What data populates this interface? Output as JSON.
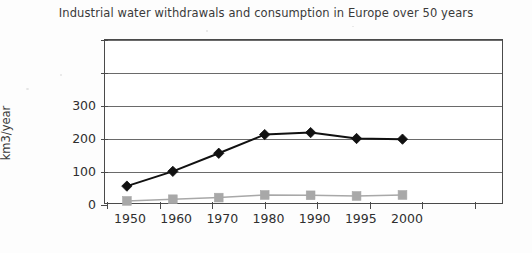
{
  "chart_data": {
    "type": "line",
    "title": "Industrial water withdrawals and consumption in Europe over 50 years",
    "xlabel": "",
    "ylabel": "Industrial water use km3/year",
    "ylabel_line1": "Industrial water use",
    "ylabel_line2": "km3/year",
    "categories": [
      "1950",
      "1960",
      "1970",
      "1980",
      "1990",
      "1995",
      "2000"
    ],
    "ylim": [
      0,
      500
    ],
    "ytick_values": [
      0,
      100,
      200,
      300,
      400,
      500
    ],
    "ytick_labels": [
      "0",
      "100",
      "200",
      "300",
      "",
      ""
    ],
    "grid": true,
    "grid_axis": "y",
    "legend": "none",
    "series": [
      {
        "name": "Industrial water withdrawals",
        "marker": "diamond",
        "color": "#111111",
        "values": [
          55,
          100,
          155,
          212,
          218,
          200,
          198
        ]
      },
      {
        "name": "Industrial water consumption",
        "marker": "square",
        "color": "#a8a8a8",
        "values": [
          10,
          15,
          20,
          28,
          27,
          25,
          28
        ]
      }
    ]
  },
  "colors": {
    "withdrawals": "#111111",
    "consumption": "#a8a8a8",
    "axis": "#4a4a4a",
    "gridline": "#6a6a6a",
    "text": "#2f2f2f",
    "background": "#fdfdfd"
  }
}
